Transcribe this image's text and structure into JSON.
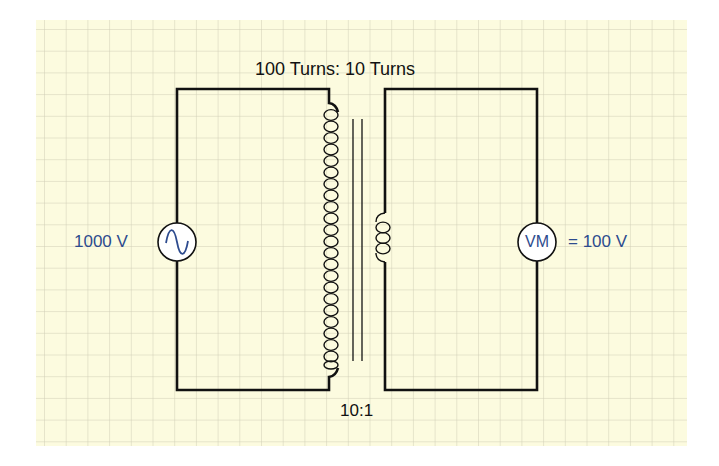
{
  "diagram": {
    "title": "100 Turns: 10 Turns",
    "ratio_label": "10:1",
    "primary": {
      "source_label": "1000 V",
      "source_icon": "ac-sine-source-icon",
      "coil_turns_drawn": 22
    },
    "secondary": {
      "meter_symbol": "VM",
      "meter_reading": "= 100 V",
      "coil_turns_drawn": 3
    },
    "colors": {
      "background": "#fcfbdf",
      "grid_line": "#cfcdb6",
      "wire": "#111111",
      "label_blue": "#2d4b8e",
      "symbol_fill": "#ffffff"
    }
  }
}
